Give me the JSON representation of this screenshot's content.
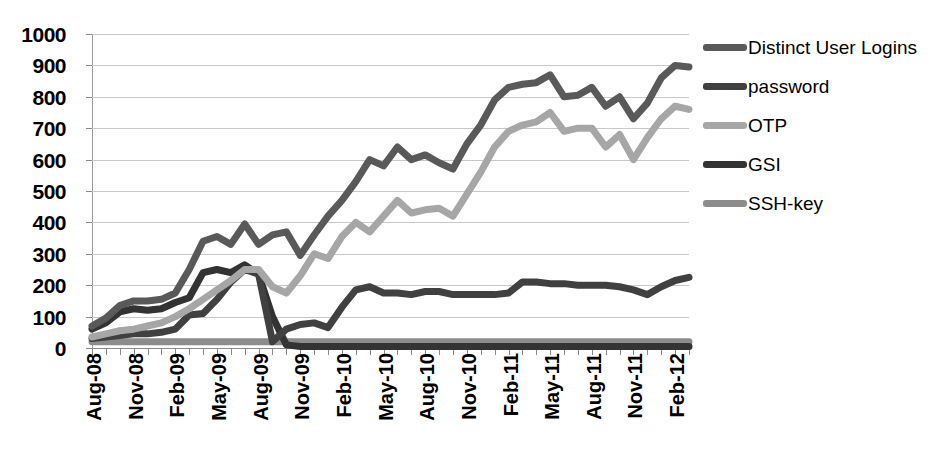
{
  "chart_data": {
    "type": "line",
    "title": "",
    "xlabel": "",
    "ylabel": "",
    "ylim": [
      0,
      1000
    ],
    "ytick_step": 100,
    "yticks": [
      "1000",
      "900",
      "800",
      "700",
      "600",
      "500",
      "400",
      "300",
      "200",
      "100",
      "0"
    ],
    "grid": true,
    "legend_position": "right",
    "x": [
      "Aug-08",
      "Sep-08",
      "Oct-08",
      "Nov-08",
      "Dec-08",
      "Jan-09",
      "Feb-09",
      "Mar-09",
      "Apr-09",
      "May-09",
      "Jun-09",
      "Jul-09",
      "Aug-09",
      "Sep-09",
      "Oct-09",
      "Nov-09",
      "Dec-09",
      "Jan-10",
      "Feb-10",
      "Mar-10",
      "Apr-10",
      "May-10",
      "Jun-10",
      "Jul-10",
      "Aug-10",
      "Sep-10",
      "Oct-10",
      "Nov-10",
      "Dec-10",
      "Jan-11",
      "Feb-11",
      "Mar-11",
      "Apr-11",
      "May-11",
      "Jun-11",
      "Jul-11",
      "Aug-11",
      "Sep-11",
      "Oct-11",
      "Nov-11",
      "Dec-11",
      "Jan-12",
      "Feb-12",
      "Mar-12"
    ],
    "xtick_labels": [
      "Aug-08",
      "Nov-08",
      "Feb-09",
      "May-09",
      "Aug-09",
      "Nov-09",
      "Feb-10",
      "May-10",
      "Aug-10",
      "Nov-10",
      "Feb-11",
      "May-11",
      "Aug-11",
      "Nov-11",
      "Feb-12"
    ],
    "xtick_indices": [
      0,
      3,
      6,
      9,
      12,
      15,
      18,
      21,
      24,
      27,
      30,
      33,
      36,
      39,
      42
    ],
    "series": [
      {
        "name": "Distinct User Logins",
        "color": "#595959",
        "values": [
          70,
          95,
          135,
          150,
          150,
          155,
          175,
          250,
          340,
          355,
          330,
          395,
          330,
          360,
          370,
          295,
          360,
          420,
          470,
          530,
          600,
          580,
          640,
          600,
          615,
          590,
          570,
          650,
          710,
          790,
          830,
          840,
          845,
          870,
          800,
          805,
          830,
          770,
          800,
          730,
          780,
          860,
          900,
          895
        ]
      },
      {
        "name": "password",
        "color": "#404040",
        "values": [
          30,
          35,
          40,
          45,
          45,
          50,
          60,
          105,
          110,
          155,
          210,
          250,
          235,
          20,
          60,
          75,
          80,
          65,
          130,
          185,
          195,
          175,
          175,
          170,
          180,
          180,
          170,
          170,
          170,
          170,
          175,
          210,
          210,
          205,
          205,
          200,
          200,
          200,
          195,
          185,
          170,
          195,
          215,
          225
        ]
      },
      {
        "name": "OTP",
        "color": "#a6a6a6",
        "values": [
          35,
          45,
          55,
          60,
          70,
          80,
          100,
          125,
          155,
          185,
          215,
          250,
          250,
          195,
          175,
          230,
          300,
          285,
          355,
          400,
          370,
          420,
          470,
          430,
          440,
          445,
          420,
          490,
          560,
          640,
          690,
          710,
          720,
          750,
          690,
          700,
          700,
          640,
          680,
          600,
          670,
          730,
          770,
          760
        ]
      },
      {
        "name": "GSI",
        "color": "#333333",
        "values": [
          60,
          80,
          115,
          125,
          120,
          125,
          145,
          160,
          240,
          250,
          240,
          265,
          235,
          100,
          10,
          5,
          5,
          5,
          5,
          5,
          5,
          5,
          5,
          5,
          5,
          5,
          5,
          5,
          5,
          5,
          5,
          5,
          5,
          5,
          5,
          5,
          5,
          5,
          5,
          5,
          5,
          5,
          5,
          5
        ]
      },
      {
        "name": "SSH-key",
        "color": "#8c8c8c",
        "values": [
          20,
          20,
          20,
          20,
          20,
          20,
          20,
          20,
          20,
          20,
          20,
          20,
          20,
          20,
          20,
          20,
          20,
          20,
          20,
          20,
          20,
          20,
          20,
          20,
          20,
          20,
          20,
          20,
          20,
          20,
          20,
          20,
          20,
          20,
          20,
          20,
          20,
          20,
          20,
          20,
          20,
          20,
          20,
          20
        ]
      }
    ]
  },
  "legend": {
    "items": [
      {
        "label": "Distinct User Logins",
        "color": "#595959"
      },
      {
        "label": "password",
        "color": "#404040"
      },
      {
        "label": "OTP",
        "color": "#a6a6a6"
      },
      {
        "label": "GSI",
        "color": "#333333"
      },
      {
        "label": "SSH-key",
        "color": "#8c8c8c"
      }
    ]
  }
}
